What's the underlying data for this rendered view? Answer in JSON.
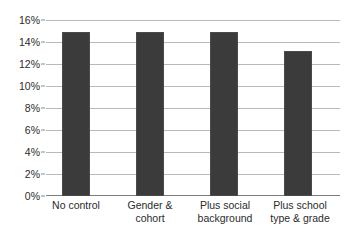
{
  "chart_data": {
    "type": "bar",
    "title": "",
    "xlabel": "",
    "ylabel": "",
    "ylim": [
      0,
      16
    ],
    "grid": true,
    "legend": "none",
    "y_tick_labels": [
      "16%",
      "14%",
      "12%",
      "10%",
      "8%",
      "6%",
      "4%",
      "2%",
      "0%"
    ],
    "y_tick_values": [
      16,
      14,
      12,
      10,
      8,
      6,
      4,
      2,
      0
    ],
    "categories": [
      "No control",
      "Gender & cohort",
      "Plus social background",
      "Plus school type & grade"
    ],
    "category_lines": [
      [
        "No control"
      ],
      [
        "Gender &",
        "cohort"
      ],
      [
        "Plus social",
        "background"
      ],
      [
        "Plus school",
        "type & grade"
      ]
    ],
    "values": [
      15.0,
      15.0,
      15.0,
      13.3
    ],
    "value_labels": [
      "15%",
      "15%",
      "15%",
      "13.3%"
    ],
    "bar_color": "#3b3b3b",
    "gridline_color": "#b9b9b9",
    "axis_color": "#7d7d7d",
    "background_color": "#ffffff"
  }
}
